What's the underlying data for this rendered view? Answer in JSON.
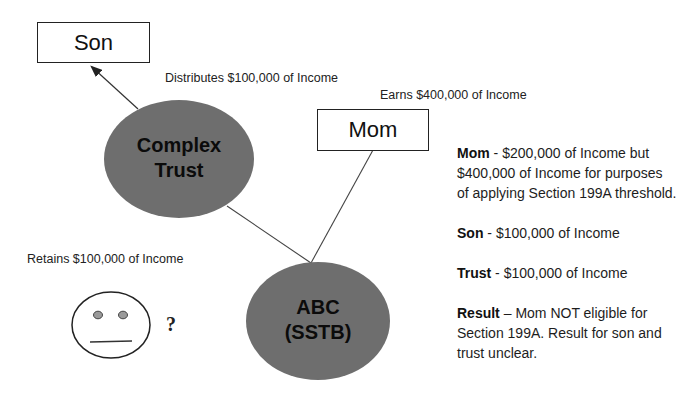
{
  "diagram": {
    "nodes": {
      "son": {
        "label": "Son"
      },
      "mom": {
        "label": "Mom"
      },
      "complex_trust": {
        "line1": "Complex",
        "line2": "Trust"
      },
      "abc": {
        "line1": "ABC",
        "line2": "(SSTB)"
      }
    },
    "edge_labels": {
      "distributes": "Distributes $100,000 of Income",
      "earns": "Earns $400,000 of Income",
      "retains": "Retains $100,000 of Income"
    },
    "face": {
      "icon": "neutral-face-icon",
      "question": "?"
    },
    "colors": {
      "ellipse_fill": "#6e6e6e",
      "stroke": "#333333",
      "eye_fill": "#9a9a9a"
    }
  },
  "summary": [
    {
      "label": "Mom",
      "sep": " - ",
      "text": "$200,000 of Income but $400,000 of Income for purposes of applying Section 199A threshold."
    },
    {
      "label": "Son",
      "sep": " - ",
      "text": "$100,000 of Income"
    },
    {
      "label": "Trust",
      "sep": " - ",
      "text": "$100,000 of Income"
    },
    {
      "label": "Result",
      "sep": " – ",
      "text": "Mom NOT eligible for Section 199A.  Result for son and trust unclear."
    }
  ]
}
